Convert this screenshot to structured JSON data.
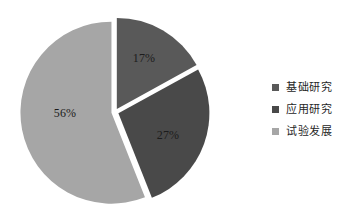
{
  "chart_data": {
    "type": "pie",
    "title": "",
    "subtitle": "",
    "xlabel": "",
    "ylabel": "",
    "grid": false,
    "legend_position": "right",
    "categories": [
      "基础研究",
      "应用研究",
      "试验发展"
    ],
    "values": [
      17,
      27,
      56
    ],
    "unit": "%",
    "data_labels": [
      "17%",
      "27%",
      "56%"
    ],
    "colors": [
      "#595959",
      "#494949",
      "#a6a6a6"
    ],
    "slices": [
      {
        "label": "基础研究",
        "value": 17,
        "display": "17%",
        "color": "#595959"
      },
      {
        "label": "应用研究",
        "value": 27,
        "display": "27%",
        "color": "#494949"
      },
      {
        "label": "试验发展",
        "value": 56,
        "display": "56%",
        "color": "#a6a6a6"
      }
    ]
  },
  "labels": {
    "basic": "17%",
    "applied": "27%",
    "experimental": "56%"
  },
  "legend": {
    "items": [
      {
        "label": "基础研究",
        "color": "#595959"
      },
      {
        "label": "应用研究",
        "color": "#494949"
      },
      {
        "label": "试验发展",
        "color": "#a6a6a6"
      }
    ]
  },
  "style": {
    "background": "#ffffff",
    "separator": "#ffffff",
    "label_color": "#1c1c1c"
  }
}
